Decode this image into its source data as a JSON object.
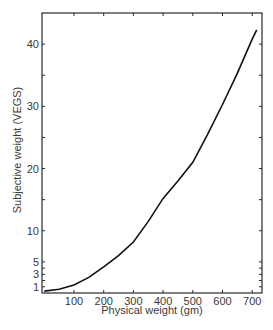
{
  "chart_data": {
    "type": "line",
    "title": "",
    "xlabel": "Physical weight (gm)",
    "ylabel": "Subjective weight (VEGS)",
    "xlim": [
      -7,
      730
    ],
    "ylim": [
      0,
      45
    ],
    "x_ticks": [
      100,
      200,
      300,
      400,
      500,
      600,
      700
    ],
    "y_ticks": [
      1,
      3,
      5,
      10,
      20,
      30,
      40
    ],
    "y_minor_ticks": [
      2,
      4,
      15,
      25,
      35
    ],
    "grid": false,
    "legend": null,
    "series": [
      {
        "name": "Subjective weight",
        "x": [
          0,
          50,
          100,
          150,
          200,
          250,
          300,
          350,
          400,
          450,
          500,
          550,
          600,
          650,
          700,
          715
        ],
        "y": [
          0.3,
          0.6,
          1.3,
          2.5,
          4.2,
          6.0,
          8.2,
          11.5,
          15.2,
          18.0,
          21.0,
          25.5,
          30.3,
          35.3,
          40.8,
          42.3
        ]
      }
    ],
    "line_color": "#111111"
  }
}
